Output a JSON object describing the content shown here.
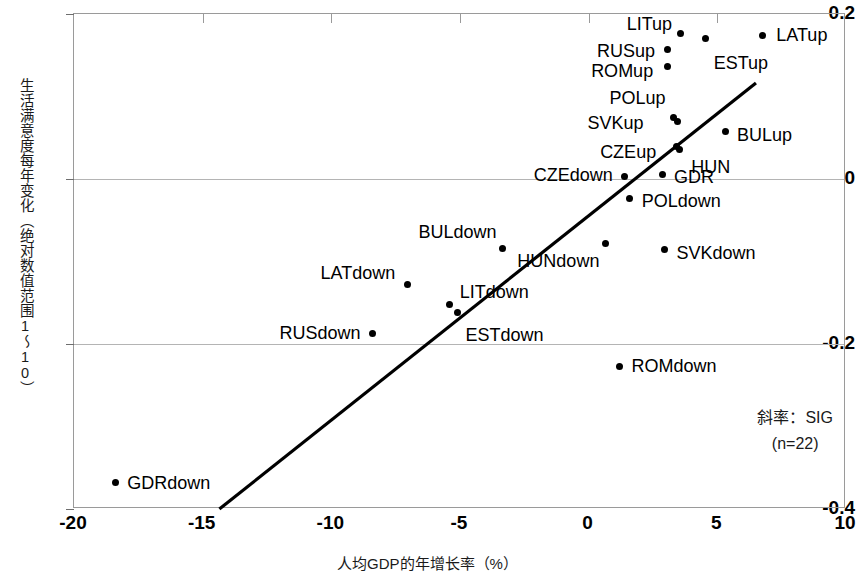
{
  "chart_data": {
    "type": "scatter",
    "title": "",
    "xlabel": "人均GDP的年增长率（%）",
    "ylabel": "生活满意度每年变化（绝对数值范围1～10）",
    "xlim": [
      -20,
      10
    ],
    "ylim": [
      -0.4,
      0.2
    ],
    "xticks": [
      "-20",
      "-15",
      "-10",
      "-5",
      "0",
      "5",
      "10"
    ],
    "xtick_values": [
      -20,
      -15,
      -10,
      -5,
      0,
      5,
      10
    ],
    "yticks": [
      "0.2",
      "0",
      "-0.2",
      "-0.4"
    ],
    "ytick_values": [
      0.2,
      0,
      -0.2,
      -0.4
    ],
    "grid": "horizontal",
    "legend": "none",
    "annotation_slope": "斜率：SIG",
    "annotation_n": "(n=22)",
    "trendline": {
      "x_start": -14.35,
      "y_start": -0.4,
      "x_end": 6.5,
      "y_end": 0.1165
    },
    "points": [
      {
        "label": "LATup",
        "x": 6.75,
        "y": 0.174,
        "label_dx": 14,
        "label_dy": 0,
        "label_align": "left"
      },
      {
        "label": "LITup",
        "x": 3.55,
        "y": 0.176,
        "label_dx": -8,
        "label_dy": -10,
        "label_align": "right"
      },
      {
        "label": "RUSup",
        "x": 3.05,
        "y": 0.157,
        "label_dx": -12,
        "label_dy": 2,
        "label_align": "right"
      },
      {
        "label": "ESTup",
        "x": 4.55,
        "y": 0.17,
        "label_dx": 8,
        "label_dy": 24,
        "label_align": "left"
      },
      {
        "label": "ROMup",
        "x": 3.05,
        "y": 0.136,
        "label_dx": -14,
        "label_dy": 4,
        "label_align": "right"
      },
      {
        "label": "POLup",
        "x": 3.3,
        "y": 0.074,
        "label_dx": -8,
        "label_dy": -20,
        "label_align": "right"
      },
      {
        "label": "SVKup",
        "x": 3.45,
        "y": 0.07,
        "label_dx": -34,
        "label_dy": 2,
        "label_align": "right"
      },
      {
        "label": "CZEup",
        "x": 3.4,
        "y": 0.04,
        "label_dx": -20,
        "label_dy": 6,
        "label_align": "right"
      },
      {
        "label": "HUN",
        "x": 3.52,
        "y": 0.036,
        "label_dx": 12,
        "label_dy": 18,
        "label_align": "left"
      },
      {
        "label": "BULup",
        "x": 5.3,
        "y": 0.058,
        "label_dx": 12,
        "label_dy": 4,
        "label_align": "left"
      },
      {
        "label": "GDR",
        "x": 2.85,
        "y": 0.005,
        "label_dx": 12,
        "label_dy": 2,
        "label_align": "left"
      },
      {
        "label": "CZEdown",
        "x": 1.4,
        "y": 0.003,
        "label_dx": -12,
        "label_dy": -2,
        "label_align": "right"
      },
      {
        "label": "POLdown",
        "x": 1.6,
        "y": -0.024,
        "label_dx": 12,
        "label_dy": 2,
        "label_align": "left"
      },
      {
        "label": "SVKdown",
        "x": 2.95,
        "y": -0.085,
        "label_dx": 12,
        "label_dy": 4,
        "label_align": "left"
      },
      {
        "label": "HUNdown",
        "x": 0.65,
        "y": -0.078,
        "label_dx": -6,
        "label_dy": 18,
        "label_align": "right"
      },
      {
        "label": "BULdown",
        "x": -3.35,
        "y": -0.084,
        "label_dx": -6,
        "label_dy": -16,
        "label_align": "right"
      },
      {
        "label": "LATdown",
        "x": -7.05,
        "y": -0.128,
        "label_dx": -12,
        "label_dy": -12,
        "label_align": "right"
      },
      {
        "label": "LITdown",
        "x": -5.4,
        "y": -0.152,
        "label_dx": 10,
        "label_dy": -12,
        "label_align": "left"
      },
      {
        "label": "ESTdown",
        "x": -5.1,
        "y": -0.162,
        "label_dx": 8,
        "label_dy": 22,
        "label_align": "left"
      },
      {
        "label": "RUSdown",
        "x": -8.4,
        "y": -0.187,
        "label_dx": -12,
        "label_dy": 0,
        "label_align": "right"
      },
      {
        "label": "ROMdown",
        "x": 1.2,
        "y": -0.227,
        "label_dx": 12,
        "label_dy": 0,
        "label_align": "left"
      },
      {
        "label": "GDRdown",
        "x": -18.4,
        "y": -0.368,
        "label_dx": 12,
        "label_dy": 0,
        "label_align": "left"
      }
    ]
  }
}
